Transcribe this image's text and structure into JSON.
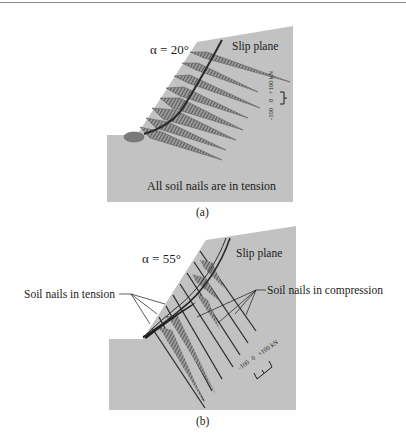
{
  "figure": {
    "panel_a": {
      "caption": "(a)",
      "alpha_label": "α = 20°",
      "slip_plane_label": "Slip plane",
      "footer_label": "All soil nails are in tension",
      "scale": {
        "neg": "-100",
        "zero": "0",
        "pos": "+100 kN"
      }
    },
    "panel_b": {
      "caption": "(b)",
      "alpha_label": "α = 55°",
      "slip_plane_label": "Slip plane",
      "tension_label": "Soil nails in tension",
      "compression_label": "Soil nails in compression",
      "scale": {
        "neg": "-100",
        "zero": "0",
        "pos": "+100 kN"
      }
    }
  },
  "colors": {
    "soil": "#c2c2c2",
    "nail_dark": "#3a3a3a",
    "hatch": "#6e6e6e",
    "text": "#1a1a1a"
  }
}
